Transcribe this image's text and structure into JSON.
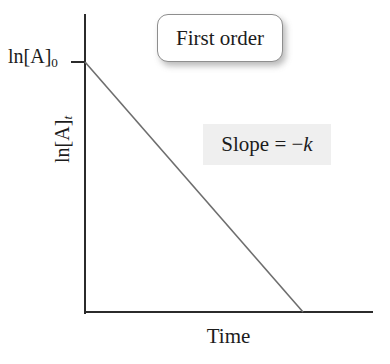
{
  "figure": {
    "background_color": "#ffffff",
    "ink_color": "#2b2b2b",
    "title_box": {
      "label": "First order",
      "border_color": "#8e8e8e",
      "fill_color": "#ffffff"
    },
    "annotation": {
      "full_text": "Slope = −k",
      "prefix": "Slope = −",
      "variable": "k",
      "background_color": "#efefef"
    },
    "axes": {
      "y_value_label_prefix": "ln[A]",
      "y_value_label_subscript": "0",
      "y_title_prefix": "ln[A]",
      "y_title_subscript": "t",
      "x_title": "Time"
    }
  },
  "chart_data": {
    "type": "line",
    "title": "First order",
    "xlabel": "Time",
    "ylabel": "ln[A]t",
    "grid": false,
    "legend": false,
    "annotations": [
      {
        "text": "Slope = −k",
        "x": 0.55,
        "y": 0.72
      },
      {
        "text": "First order",
        "x": 0.45,
        "y": 0.95
      }
    ],
    "axis_tick_labels": {
      "y": [
        "ln[A]0"
      ],
      "x": []
    },
    "xlim": [
      0,
      1
    ],
    "ylim": [
      0,
      1
    ],
    "series": [
      {
        "name": "ln[A]t vs Time",
        "x": [
          0,
          1
        ],
        "y": [
          1,
          0
        ],
        "slope_label": "−k",
        "color": "#6e6e6e",
        "linewidth": 1.6
      }
    ]
  }
}
